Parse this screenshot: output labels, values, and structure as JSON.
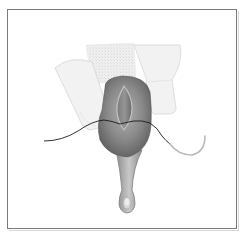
{
  "figure": {
    "type": "medical-illustration",
    "elements": {
      "left_finger": "left-finger",
      "right_finger": "right-finger",
      "gauze": "gauze-pad",
      "tissue_mass": "tissue-mass",
      "incision": "incision",
      "stalk": "tissue-stalk",
      "suture": "suture-thread",
      "needle": "curved-needle"
    },
    "colors": {
      "frame_border": "#7a7a7a",
      "tissue_dark": "#6e6e6e",
      "tissue_mid": "#9a9a9a",
      "finger_fill": "#f1f1f1",
      "finger_stroke": "#d4d4d4",
      "suture": "#1a1a1a",
      "needle": "#b8b8b8"
    }
  }
}
